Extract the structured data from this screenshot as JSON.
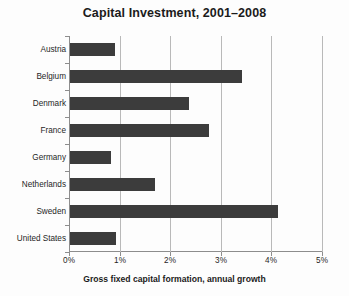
{
  "chart_data": {
    "type": "bar",
    "orientation": "horizontal",
    "title": "Capital Investment, 2001–2008",
    "xlabel": "Gross fixed capital formation, annual growth",
    "ylabel": "",
    "categories": [
      "Austria",
      "Belgium",
      "Denmark",
      "France",
      "Germany",
      "Netherlands",
      "Sweden",
      "United States"
    ],
    "values": [
      0.88,
      3.4,
      2.35,
      2.75,
      0.82,
      1.68,
      4.11,
      0.91
    ],
    "xlim": [
      0,
      5
    ],
    "xticks": [
      0,
      1,
      2,
      3,
      4,
      5
    ],
    "xtick_labels": [
      "0%",
      "1%",
      "2%",
      "3%",
      "4%",
      "5%"
    ],
    "grid": "vertical",
    "legend": "none",
    "bar_color": "#3c3c3c",
    "grid_color": "#b9b9b9",
    "axis_color": "#8d8d8d",
    "background_color": "#fdfdfd",
    "units": "percent"
  }
}
